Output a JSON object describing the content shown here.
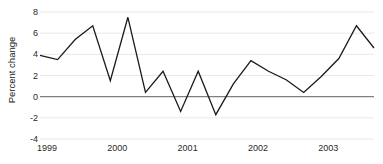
{
  "chart_data": {
    "type": "line",
    "title": "",
    "subtitle": "",
    "xlabel": "",
    "ylabel": "Percent change",
    "ylim": [
      -4,
      8
    ],
    "yticks": [
      8,
      6,
      4,
      2,
      0,
      -2,
      -4
    ],
    "ytick_labels": [
      "8",
      "6",
      "4",
      "2",
      "0",
      "-2",
      "-4"
    ],
    "xlim": [
      1999.0,
      2003.75
    ],
    "xticks": [
      1999,
      2000,
      2001,
      2002,
      2003
    ],
    "xtick_labels": [
      "1999",
      "2000",
      "2001",
      "2002",
      "2003"
    ],
    "grid": "horizontal",
    "legend": "none",
    "zero_line": true,
    "series": [
      {
        "name": "Percent change",
        "color": "#1a1a1a",
        "x": [
          1999.0,
          1999.25,
          1999.5,
          1999.75,
          2000.0,
          2000.25,
          2000.5,
          2000.75,
          2001.0,
          2001.25,
          2001.5,
          2001.75,
          2002.0,
          2002.25,
          2002.5,
          2002.75,
          2003.0,
          2003.25,
          2003.5,
          2003.75
        ],
        "x_labels": [
          "1999 Q1",
          "1999 Q2",
          "1999 Q3",
          "1999 Q4",
          "2000 Q1",
          "2000 Q2",
          "2000 Q3",
          "2000 Q4",
          "2001 Q1",
          "2001 Q2",
          "2001 Q3",
          "2001 Q4",
          "2002 Q1",
          "2002 Q2",
          "2002 Q3",
          "2002 Q4",
          "2003 Q1",
          "2003 Q2",
          "2003 Q3",
          "2003 Q4"
        ],
        "values": [
          3.9,
          3.5,
          5.4,
          6.7,
          1.5,
          7.5,
          0.4,
          2.4,
          -1.4,
          2.4,
          -1.7,
          1.2,
          3.4,
          2.4,
          1.6,
          0.4,
          1.9,
          3.6,
          6.7,
          4.6
        ]
      }
    ],
    "colors": {
      "line": "#1a1a1a",
      "gridline": "#e9e9e9",
      "zero_line": "#808080",
      "axis_text": "#2a2a2a",
      "background": "#ffffff"
    }
  }
}
